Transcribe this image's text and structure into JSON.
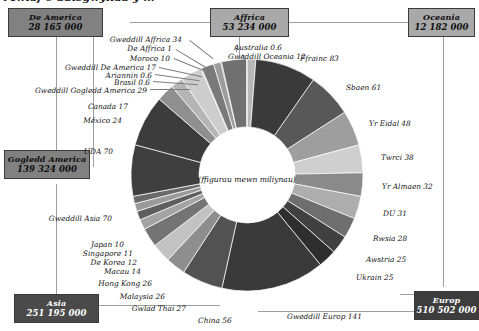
{
  "title": "Mwiaf o ddisgwyliad y ...",
  "center_note": "(ffigurau mewn miliynau)",
  "boxes": [
    {
      "key": "de_america",
      "name": "De America",
      "value": "28 165 000",
      "style": "mid-gray"
    },
    {
      "key": "affrica",
      "name": "Affrica",
      "value": "53 234 000",
      "style": "light-gray"
    },
    {
      "key": "oceania",
      "name": "Oceania",
      "value": "12 182 000",
      "style": "light-gray"
    },
    {
      "key": "gogledd_america",
      "name": "Gogledd America",
      "value": "139 324 000",
      "style": "mid-gray"
    },
    {
      "key": "asia",
      "name": "Asia",
      "value": "251 195 000",
      "style": "darker-gray"
    },
    {
      "key": "europ",
      "name": "Europ",
      "value": "510 502 000",
      "style": "dark-gray"
    }
  ],
  "chart_data": {
    "type": "pie",
    "title": "Mwiaf o ddisgwyliad y ...",
    "subtitle": "(ffigurau mewn miliynau)",
    "unit": "miliynau",
    "legend": "none",
    "grid": false,
    "labels": [
      "Gweddill Oceania 12",
      "Ffrainc 83",
      "Sbaen 61",
      "Yr Eidal 48",
      "Twrci 38",
      "Yr Almaen 32",
      "DU 31",
      "Rwsia 28",
      "Awstria 25",
      "Ukrain 25",
      "Gweddill Europ 141",
      "China 56",
      "Gwlad Thai 27",
      "Malaysia 26",
      "Hong Kong 26",
      "Macau 14",
      "De Korea 12",
      "Singapore 11",
      "Japan 10",
      "Gweddill Asia 70",
      "UDA 70",
      "México 24",
      "Canada 17",
      "Gweddill Gogledd America 29",
      "Brasil 0.6",
      "Ariannin 0.6",
      "Gweddill De America 17",
      "Moroco 10",
      "De Affrica 1",
      "Gweddill Affrica 34",
      "Australia 0.6"
    ],
    "categories": [
      "Gweddill Oceania",
      "Ffrainc",
      "Sbaen",
      "Yr Eidal",
      "Twrci",
      "Yr Almaen",
      "DU",
      "Rwsia",
      "Awstria",
      "Ukrain",
      "Gweddill Europ",
      "China",
      "Gwlad Thai",
      "Malaysia",
      "Hong Kong",
      "Macau",
      "De Korea",
      "Singapore",
      "Japan",
      "Gweddill Asia",
      "UDA",
      "México",
      "Canada",
      "Gweddill Gogledd America",
      "Brasil",
      "Ariannin",
      "Gweddill De America",
      "Moroco",
      "De Affrica",
      "Gweddill Affrica",
      "Australia"
    ],
    "values": [
      12,
      83,
      61,
      48,
      38,
      32,
      31,
      28,
      25,
      25,
      141,
      56,
      27,
      26,
      26,
      14,
      12,
      11,
      10,
      70,
      70,
      24,
      17,
      29,
      0.6,
      0.6,
      17,
      10,
      1,
      34,
      0.6
    ],
    "colors": [
      "#b8b8b8",
      "#3a3a3a",
      "#585858",
      "#9e9e9e",
      "#cfcfcf",
      "#8a8a8a",
      "#adadad",
      "#6e6e6e",
      "#404040",
      "#2e2e2e",
      "#3a3a3a",
      "#525252",
      "#8e8e8e",
      "#c2c2c2",
      "#747474",
      "#a3a3a3",
      "#5e5e5e",
      "#9a9a9a",
      "#6a6a6a",
      "#3f3f3f",
      "#3c3c3c",
      "#8f8f8f",
      "#b5b5b5",
      "#cdcdcd",
      "#1a1a1a",
      "#3a3a3a",
      "#7a7a7a",
      "#9c9c9c",
      "#2b2b2b",
      "#707070",
      "#1f1f1f"
    ]
  },
  "slice_labels": [
    {
      "key": "gweddill-affrica",
      "text": "Gweddill Affrica 34"
    },
    {
      "key": "de-affrica",
      "text": "De Affrica 1"
    },
    {
      "key": "moroco",
      "text": "Moroco 10"
    },
    {
      "key": "gweddill-de-america",
      "text": "Gweddill De America 17"
    },
    {
      "key": "ariannin",
      "text": "Ariannin 0.6"
    },
    {
      "key": "brasil",
      "text": "Brasil 0.6"
    },
    {
      "key": "gweddill-gogledd-america",
      "text": "Gweddill Gogledd America 29"
    },
    {
      "key": "canada",
      "text": "Canada 17"
    },
    {
      "key": "mexico",
      "text": "México 24"
    },
    {
      "key": "uda",
      "text": "UDA 70"
    },
    {
      "key": "gweddill-asia",
      "text": "Gweddill Asia 70"
    },
    {
      "key": "japan",
      "text": "Japan 10"
    },
    {
      "key": "singapore",
      "text": "Singapore 11"
    },
    {
      "key": "de-korea",
      "text": "De Korea 12"
    },
    {
      "key": "macau",
      "text": "Macau 14"
    },
    {
      "key": "hong-kong",
      "text": "Hong Kong 26"
    },
    {
      "key": "malaysia",
      "text": "Malaysia 26"
    },
    {
      "key": "gwlad-thai",
      "text": "Gwlad Thai 27"
    },
    {
      "key": "china",
      "text": "China 56"
    },
    {
      "key": "gweddill-europ",
      "text": "Gweddill Europ 141"
    },
    {
      "key": "ukrain",
      "text": "Ukrain 25"
    },
    {
      "key": "awstria",
      "text": "Awstria 25"
    },
    {
      "key": "rwsia",
      "text": "Rwsia 28"
    },
    {
      "key": "du",
      "text": "DU 31"
    },
    {
      "key": "yr-almaen",
      "text": "Yr Almaen 32"
    },
    {
      "key": "twrci",
      "text": "Twrci 38"
    },
    {
      "key": "yr-eidal",
      "text": "Yr Eidal 48"
    },
    {
      "key": "sbaen",
      "text": "Sbaen 61"
    },
    {
      "key": "ffrainc",
      "text": "Ffrainc 83"
    },
    {
      "key": "gweddill-oceania",
      "text": "Gweddill Oceania 12"
    },
    {
      "key": "australia",
      "text": "Australia 0.6"
    }
  ]
}
